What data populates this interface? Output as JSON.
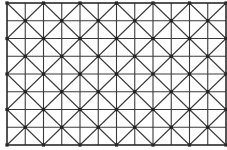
{
  "diagram": {
    "type": "grid-lattice",
    "frame": {
      "x0": 7,
      "y0": 3,
      "x1": 226,
      "y1": 145
    },
    "grid": {
      "cols": 12,
      "rows": 8
    },
    "colors": {
      "line": "#3a3a3a",
      "frame": "#2a2a2a",
      "node": "#222222",
      "background": "#ffffff"
    }
  }
}
